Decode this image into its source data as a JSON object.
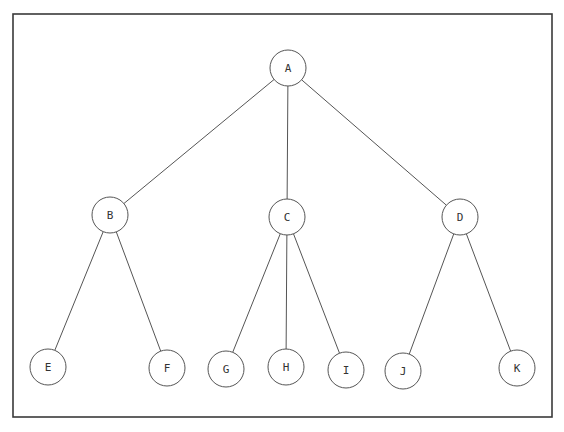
{
  "diagram": {
    "type": "tree",
    "frame": {
      "x": 13,
      "y": 14,
      "width": 539,
      "height": 403
    },
    "node_radius": 18,
    "nodes": [
      {
        "id": "A",
        "label": "A",
        "x": 288,
        "y": 68,
        "level": 0
      },
      {
        "id": "B",
        "label": "B",
        "x": 110,
        "y": 215,
        "level": 1
      },
      {
        "id": "C",
        "label": "C",
        "x": 287,
        "y": 217,
        "level": 1
      },
      {
        "id": "D",
        "label": "D",
        "x": 460,
        "y": 217,
        "level": 1
      },
      {
        "id": "E",
        "label": "E",
        "x": 48,
        "y": 367,
        "level": 2
      },
      {
        "id": "F",
        "label": "F",
        "x": 167,
        "y": 368,
        "level": 2
      },
      {
        "id": "G",
        "label": "G",
        "x": 226,
        "y": 369,
        "level": 2
      },
      {
        "id": "H",
        "label": "H",
        "x": 286,
        "y": 367,
        "level": 2
      },
      {
        "id": "I",
        "label": "I",
        "x": 346,
        "y": 370,
        "level": 2
      },
      {
        "id": "J",
        "label": "J",
        "x": 403,
        "y": 371,
        "level": 2
      },
      {
        "id": "K",
        "label": "K",
        "x": 517,
        "y": 368,
        "level": 2
      }
    ],
    "edges": [
      {
        "from": "A",
        "to": "B"
      },
      {
        "from": "A",
        "to": "C"
      },
      {
        "from": "A",
        "to": "D"
      },
      {
        "from": "B",
        "to": "E"
      },
      {
        "from": "B",
        "to": "F"
      },
      {
        "from": "C",
        "to": "G"
      },
      {
        "from": "C",
        "to": "H"
      },
      {
        "from": "C",
        "to": "I"
      },
      {
        "from": "D",
        "to": "J"
      },
      {
        "from": "D",
        "to": "K"
      }
    ],
    "colors": {
      "frame": "#3a3a3a",
      "edge": "#555555",
      "node_stroke": "#555555",
      "node_fill": "#ffffff",
      "label": "#333333",
      "background": "#ffffff"
    }
  }
}
